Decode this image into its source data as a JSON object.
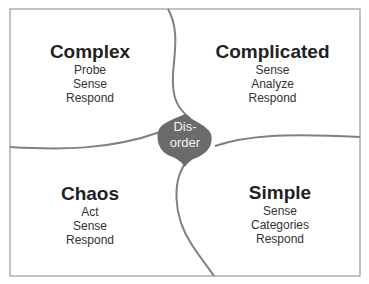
{
  "diagram": {
    "name": "Cynefin framework",
    "colors": {
      "line": "#808080",
      "disorder_fill": "#6b6b6b",
      "frame": "#9a9a9a",
      "text": "#222222"
    },
    "domains": [
      {
        "title": "Complex",
        "steps": [
          "Probe",
          "Sense",
          "Respond"
        ]
      },
      {
        "title": "Complicated",
        "steps": [
          "Sense",
          "Analyze",
          "Respond"
        ]
      },
      {
        "title": "Chaos",
        "steps": [
          "Act",
          "Sense",
          "Respond"
        ]
      },
      {
        "title": "Simple",
        "steps": [
          "Sense",
          "Categories",
          "Respond"
        ]
      }
    ],
    "center": {
      "line1": "Dis-",
      "line2": "order"
    }
  }
}
